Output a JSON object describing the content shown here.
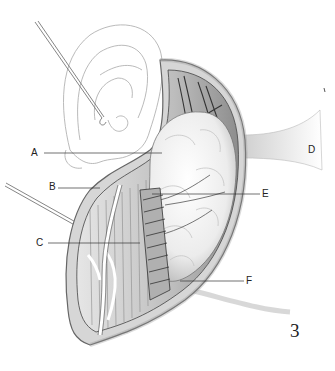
{
  "figure": {
    "number": "3",
    "labels": [
      {
        "id": "A",
        "text": "A",
        "x": 32,
        "y": 148,
        "line": [
          44,
          153,
          162,
          153
        ]
      },
      {
        "id": "B",
        "text": "B",
        "x": 49,
        "y": 182,
        "line": [
          58,
          188,
          100,
          188
        ]
      },
      {
        "id": "C",
        "text": "C",
        "x": 36,
        "y": 238,
        "line": [
          48,
          243,
          140,
          243
        ]
      },
      {
        "id": "D",
        "text": "D",
        "x": 308,
        "y": 146
      },
      {
        "id": "E",
        "text": "E",
        "x": 262,
        "y": 190,
        "line": [
          152,
          194,
          260,
          194
        ]
      },
      {
        "id": "F",
        "text": "F",
        "x": 246,
        "y": 278,
        "line": [
          180,
          281,
          244,
          281
        ]
      }
    ],
    "colors": {
      "ink": "#222222",
      "sketch": "#9a9a9a",
      "skin_edge": "#b8b8b8",
      "muscle": "#c9c9c9",
      "gland": "#f2f2f2",
      "shadow": "#555555"
    }
  }
}
